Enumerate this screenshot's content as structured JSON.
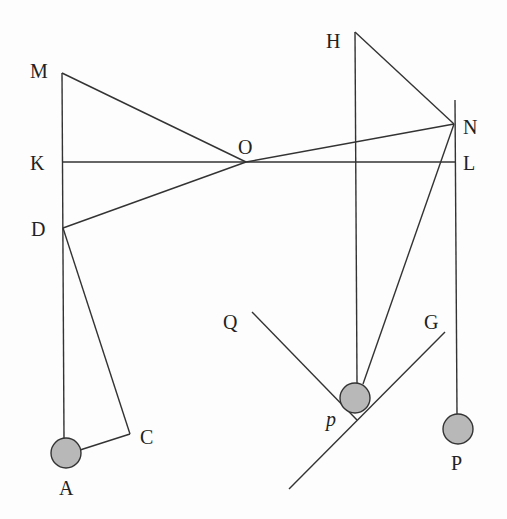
{
  "diagram": {
    "colors": {
      "line": "#333333",
      "ball_fill": "#b8b8b8",
      "ball_stroke": "#333333",
      "text": "#222222"
    },
    "labels": {
      "M": "M",
      "K": "K",
      "D": "D",
      "O": "O",
      "H": "H",
      "N": "N",
      "L": "L",
      "Q": "Q",
      "G": "G",
      "p": "p",
      "C": "C",
      "A": "A",
      "P": "P"
    },
    "points": {
      "M": [
        62,
        73
      ],
      "K": [
        62,
        162
      ],
      "D": [
        63,
        228
      ],
      "O": [
        246,
        162
      ],
      "H": [
        355,
        32
      ],
      "N": [
        454,
        124
      ],
      "L": [
        455,
        162
      ],
      "A": [
        66,
        453
      ],
      "C": [
        130,
        434
      ],
      "p": [
        355,
        398
      ],
      "P": [
        458,
        429
      ],
      "Q": [
        252,
        312
      ],
      "G": [
        445,
        332
      ]
    },
    "balls": [
      {
        "name": "A",
        "r": 15
      },
      {
        "name": "p",
        "r": 15
      },
      {
        "name": "P",
        "r": 15
      }
    ]
  }
}
